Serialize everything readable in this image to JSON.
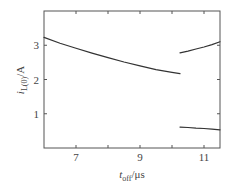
{
  "chart_data": {
    "type": "line",
    "title": "",
    "xlabel": "t_off/μs",
    "ylabel": "i_L(0)/A",
    "xlabel_parts": {
      "main": "t",
      "sub": "off",
      "unit": "/μs"
    },
    "ylabel_parts": {
      "main": "i",
      "sub": "L(0)",
      "unit": "/A"
    },
    "xlim": [
      6,
      11.5
    ],
    "ylim": [
      0,
      4
    ],
    "xticks": [
      7,
      8,
      9,
      10,
      11
    ],
    "xtick_labels": [
      "7",
      "",
      "9",
      "",
      "11"
    ],
    "yticks": [
      1,
      2,
      3
    ],
    "ytick_labels": [
      "1",
      "2",
      "3"
    ],
    "grid": false,
    "legend": null,
    "box": true,
    "line_color": "#333333",
    "series": [
      {
        "name": "branch-1",
        "x": [
          6.0,
          6.5,
          7.0,
          7.5,
          8.0,
          8.5,
          9.0,
          9.5,
          10.0,
          10.25
        ],
        "y": [
          3.23,
          3.06,
          2.91,
          2.77,
          2.64,
          2.51,
          2.4,
          2.29,
          2.21,
          2.17
        ]
      },
      {
        "name": "branch-2",
        "x": [
          10.25,
          10.5,
          10.75,
          11.0,
          11.25,
          11.5
        ],
        "y": [
          2.78,
          2.83,
          2.89,
          2.95,
          3.02,
          3.1
        ]
      },
      {
        "name": "branch-3",
        "x": [
          10.25,
          10.5,
          10.75,
          11.0,
          11.25,
          11.5
        ],
        "y": [
          0.61,
          0.6,
          0.58,
          0.57,
          0.55,
          0.53
        ]
      }
    ]
  }
}
